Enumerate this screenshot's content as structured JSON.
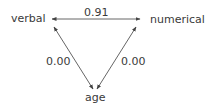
{
  "diagram": {
    "type": "path-diagram",
    "nodes": {
      "verbal": "verbal",
      "numerical": "numerical",
      "age": "age"
    },
    "edges": [
      {
        "from": "verbal",
        "to": "numerical",
        "label": "0.91",
        "bidirectional": true
      },
      {
        "from": "verbal",
        "to": "age",
        "label": "0.00",
        "bidirectional": true
      },
      {
        "from": "numerical",
        "to": "age",
        "label": "0.00",
        "bidirectional": true
      }
    ],
    "colors": {
      "line": "#555555",
      "text": "#3a3a3a",
      "background": "#ffffff"
    }
  }
}
